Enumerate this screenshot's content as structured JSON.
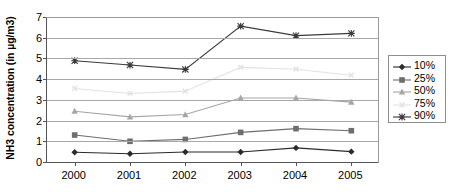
{
  "chart_data": {
    "type": "line",
    "title": "",
    "xlabel": "",
    "ylabel": "NH3 concentration (in µg/m3)",
    "categories": [
      "2000",
      "2001",
      "2002",
      "2003",
      "2004",
      "2005"
    ],
    "x": [
      2000,
      2001,
      2002,
      2003,
      2004,
      2005
    ],
    "ylim": [
      0,
      7
    ],
    "yticks": [
      "0",
      "1",
      "2",
      "3",
      "4",
      "5",
      "6",
      "7"
    ],
    "ytick_values": [
      0,
      1,
      2,
      3,
      4,
      5,
      6,
      7
    ],
    "grid": true,
    "legend_position": "right",
    "series": [
      {
        "name": "10%",
        "values": [
          0.47,
          0.4,
          0.48,
          0.48,
          0.68,
          0.5
        ],
        "color": "#2b2b2b",
        "marker": "diamond"
      },
      {
        "name": "25%",
        "values": [
          1.3,
          1.0,
          1.09,
          1.43,
          1.61,
          1.51
        ],
        "color": "#6e6e6e",
        "marker": "square"
      },
      {
        "name": "50%",
        "values": [
          2.45,
          2.18,
          2.29,
          3.09,
          3.09,
          2.89
        ],
        "color": "#a6a6a6",
        "marker": "triangle"
      },
      {
        "name": "75%",
        "values": [
          3.55,
          3.31,
          3.42,
          4.57,
          4.48,
          4.19
        ],
        "color": "#e2e2e2",
        "marker": "x-small"
      },
      {
        "name": "90%",
        "values": [
          4.89,
          4.68,
          4.47,
          6.56,
          6.1,
          6.21
        ],
        "color": "#3a3a3a",
        "marker": "star"
      }
    ]
  },
  "legend": {
    "entries": [
      "10%",
      "25%",
      "50%",
      "75%",
      "90%"
    ]
  },
  "axes": {
    "y_label": "NH3 concentration (in µg/m3)"
  }
}
